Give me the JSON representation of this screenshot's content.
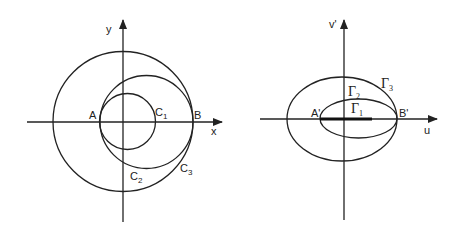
{
  "left_diagram": {
    "axes": {
      "x_label": "x",
      "y_label": "y"
    },
    "points": {
      "A": "A",
      "B": "B"
    },
    "curves": [
      {
        "name": "C",
        "sub": "1",
        "type": "circle",
        "cx": 127.5,
        "cy": 121.5,
        "r": 28
      },
      {
        "name": "C",
        "sub": "2",
        "type": "circle",
        "cx": 146.5,
        "cy": 122,
        "r": 46.5
      },
      {
        "name": "C",
        "sub": "3",
        "type": "circle",
        "cx": 123,
        "cy": 121.5,
        "r": 70
      }
    ]
  },
  "right_diagram": {
    "axes": {
      "u_label": "u",
      "v_label": "v'"
    },
    "points": {
      "A_prime": "A'",
      "B_prime": "B'"
    },
    "curves": [
      {
        "name": "Γ",
        "sub": "1",
        "type": "segment",
        "x1": 320,
        "x2": 372
      },
      {
        "name": "Γ",
        "sub": "2",
        "type": "ellipse",
        "cx": 358.5,
        "cy": 118.5,
        "rx": 38.5,
        "ry": 19.5
      },
      {
        "name": "Γ",
        "sub": "3",
        "type": "ellipse",
        "cx": 342,
        "cy": 119,
        "rx": 55,
        "ry": 42
      }
    ]
  },
  "colors": {
    "line": "#222222",
    "background": "#ffffff"
  }
}
